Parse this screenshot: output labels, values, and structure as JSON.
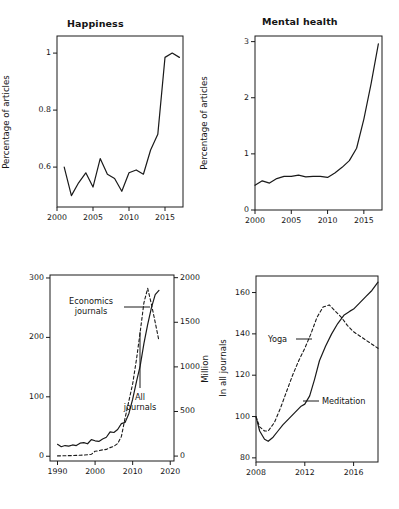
{
  "figure": {
    "background": "#ffffff",
    "ink": "#1a1a1a",
    "panels": 4
  },
  "chart_data": [
    {
      "id": "happiness",
      "type": "line",
      "title": "Happiness",
      "xlabel": "",
      "ylabel": "Percentage of articles",
      "xlim": [
        2000,
        2017.5
      ],
      "ylim": [
        0.46,
        1.06
      ],
      "xticks": [
        2000,
        2005,
        2010,
        2015
      ],
      "xticklabels": [
        "2000",
        "2005",
        "2010",
        "2015"
      ],
      "yticks": [
        0.6,
        0.8,
        1
      ],
      "yticklabels": [
        "0.6",
        "0.8",
        "1"
      ],
      "grid": false,
      "legend": "none",
      "series": [
        {
          "name": "Happiness",
          "style": "solid",
          "x": [
            2001,
            2002,
            2003,
            2004,
            2005,
            2006,
            2007,
            2008,
            2009,
            2010,
            2011,
            2012,
            2013,
            2014,
            2015,
            2016,
            2017
          ],
          "y": [
            0.6,
            0.5,
            0.545,
            0.58,
            0.53,
            0.63,
            0.575,
            0.56,
            0.515,
            0.58,
            0.59,
            0.575,
            0.66,
            0.715,
            0.985,
            1.0,
            0.985
          ]
        }
      ]
    },
    {
      "id": "mental-health",
      "type": "line",
      "title": "Mental health",
      "xlabel": "",
      "ylabel": "Percentage of articles",
      "xlim": [
        2000,
        2017.5
      ],
      "ylim": [
        0,
        3.1
      ],
      "xticks": [
        2000,
        2005,
        2010,
        2015
      ],
      "xticklabels": [
        "2000",
        "2005",
        "2010",
        "2015"
      ],
      "yticks": [
        0,
        1,
        2,
        3
      ],
      "yticklabels": [
        "0",
        "1",
        "2",
        "3"
      ],
      "grid": false,
      "legend": "none",
      "series": [
        {
          "name": "Mental health",
          "style": "solid",
          "x": [
            2000,
            2001,
            2002,
            2003,
            2004,
            2005,
            2006,
            2007,
            2008,
            2009,
            2010,
            2011,
            2012,
            2013,
            2014,
            2015,
            2016,
            2017
          ],
          "y": [
            0.44,
            0.52,
            0.48,
            0.56,
            0.6,
            0.6,
            0.62,
            0.59,
            0.6,
            0.6,
            0.58,
            0.66,
            0.76,
            0.88,
            1.1,
            1.62,
            2.25,
            2.96
          ]
        }
      ]
    },
    {
      "id": "mindfulness-journals",
      "type": "line",
      "title": "",
      "xlabel": "",
      "ylabel": "In economics journals",
      "ylabel_right": "In all journals",
      "xlim": [
        1988,
        2021
      ],
      "ylim": [
        -8,
        305
      ],
      "ylim_right": [
        -55,
        2030
      ],
      "xticks": [
        1990,
        2000,
        2010,
        2020
      ],
      "xticklabels": [
        "1990",
        "2000",
        "2010",
        "2020"
      ],
      "yticks": [
        0,
        100,
        200,
        300
      ],
      "yticklabels": [
        "0",
        "100",
        "200",
        "300"
      ],
      "yticks_right": [
        0,
        500,
        1000,
        1500,
        2000
      ],
      "yticklabels_right": [
        "0",
        "500",
        "1000",
        "1500",
        "2000"
      ],
      "grid": false,
      "legend": "annotations",
      "annotations": [
        {
          "text_line1": "Economics",
          "text_line2": "journals",
          "points_to": "dashed-series"
        },
        {
          "text_line1": "All",
          "text_line2": "journals",
          "points_to": "solid-series"
        }
      ],
      "series": [
        {
          "name": "All journals",
          "axis": "left",
          "style": "solid",
          "x": [
            1990,
            1991,
            1992,
            1993,
            1994,
            1995,
            1996,
            1997,
            1998,
            1999,
            2000,
            2001,
            2002,
            2003,
            2004,
            2005,
            2006,
            2007,
            2008,
            2009,
            2010,
            2011,
            2012,
            2013,
            2014,
            2015,
            2016,
            2017
          ],
          "y": [
            20,
            16,
            18,
            17,
            19,
            18,
            22,
            23,
            21,
            28,
            26,
            25,
            29,
            32,
            41,
            40,
            45,
            55,
            57,
            72,
            96,
            125,
            152,
            190,
            222,
            250,
            272,
            279
          ]
        },
        {
          "name": "Economics journals",
          "axis": "right",
          "style": "dashed",
          "x": [
            1990,
            1991,
            1992,
            1993,
            1994,
            1995,
            1996,
            1997,
            1998,
            1999,
            2000,
            2001,
            2002,
            2003,
            2004,
            2005,
            2006,
            2007,
            2008,
            2009,
            2010,
            2011,
            2012,
            2013,
            2014,
            2015,
            2016,
            2017
          ],
          "y": [
            2,
            3,
            4,
            5,
            6,
            8,
            10,
            12,
            16,
            20,
            55,
            60,
            70,
            75,
            95,
            110,
            140,
            220,
            430,
            620,
            810,
            1080,
            1390,
            1720,
            1880,
            1700,
            1500,
            1290
          ]
        }
      ]
    },
    {
      "id": "yoga-meditation",
      "type": "line",
      "title": "",
      "xlabel": "",
      "ylabel": "Million",
      "xlim": [
        2008,
        2018
      ],
      "ylim": [
        78,
        168
      ],
      "xticks": [
        2008,
        2012,
        2016
      ],
      "xticklabels": [
        "2008",
        "2012",
        "2016"
      ],
      "yticks": [
        80,
        100,
        120,
        140,
        160
      ],
      "yticklabels": [
        "80",
        "100",
        "120",
        "140",
        "160"
      ],
      "grid": false,
      "legend": "annotations",
      "annotations": [
        {
          "text_line1": "Yoga",
          "points_to": "dashed-series"
        },
        {
          "text_line1": "Meditation",
          "points_to": "solid-series"
        }
      ],
      "series": [
        {
          "name": "Meditation",
          "style": "solid",
          "x": [
            2008.0,
            2008.3,
            2008.7,
            2009.0,
            2009.4,
            2009.8,
            2010.2,
            2010.7,
            2011.2,
            2011.7,
            2012.0,
            2012.4,
            2012.8,
            2013.2,
            2013.7,
            2014.2,
            2014.7,
            2015.2,
            2015.7,
            2016.0,
            2016.5,
            2017.0,
            2017.5,
            2018.0
          ],
          "y": [
            100,
            93,
            89,
            88,
            90,
            93,
            96,
            99,
            102,
            105,
            106,
            110,
            118,
            127,
            134,
            140,
            145,
            149,
            151,
            152,
            155,
            158,
            161,
            165
          ]
        },
        {
          "name": "Yoga",
          "style": "dashed",
          "x": [
            2008.0,
            2008.3,
            2008.7,
            2009.0,
            2009.5,
            2010.0,
            2010.5,
            2011.0,
            2011.5,
            2012.0,
            2012.5,
            2013.0,
            2013.5,
            2014.0,
            2014.5,
            2015.0,
            2015.5,
            2016.0,
            2016.5,
            2017.0,
            2017.5,
            2018.0
          ],
          "y": [
            100,
            95,
            93,
            93,
            97,
            104,
            112,
            120,
            127,
            133,
            140,
            148,
            153,
            154,
            151,
            148,
            144,
            141,
            139,
            137,
            135,
            133
          ]
        }
      ]
    }
  ]
}
